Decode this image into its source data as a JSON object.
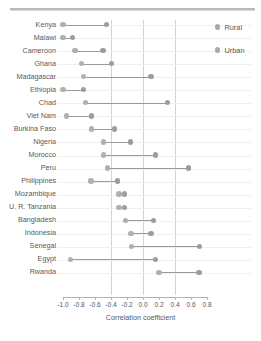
{
  "legend": {
    "position": "top-right",
    "items": [
      {
        "label": "Rural",
        "color": "#a8a8ab",
        "marker": "circle-dot"
      },
      {
        "label": "Urban",
        "color": "#a8a8ab",
        "marker": "circle-dot"
      }
    ]
  },
  "axis": {
    "title": "Correlation coefficient",
    "tick_labels": [
      "-1.0",
      "-0.8",
      "-0.6",
      "-0.4",
      "-0.2",
      "0.0",
      "0.2",
      "0.4",
      "0.6",
      "0.8"
    ]
  },
  "chart_data": {
    "type": "scatter",
    "subtype": "dumbbell",
    "title": "",
    "xlabel": "Correlation coefficient",
    "ylabel": "",
    "xlim": [
      -1.0,
      0.8
    ],
    "xticks": [
      -1.0,
      -0.8,
      -0.6,
      -0.4,
      -0.2,
      0.0,
      0.2,
      0.4,
      0.6,
      0.8
    ],
    "gridlines_vertical": [
      -0.4,
      0.0,
      0.4
    ],
    "grid": true,
    "legend_position": "top-right",
    "categories": [
      "Kenya",
      "Malawi",
      "Cameroon",
      "Ghana",
      "Madagascar",
      "Ethiopia",
      "Chad",
      "Viet Nam",
      "Burkina Faso",
      "Nigeria",
      "Morocco",
      "Peru",
      "Philippines",
      "Mozambique",
      "U. R. Tanzania",
      "Bangladesh",
      "Indonesia",
      "Senegal",
      "Egypt",
      "Rwanda"
    ],
    "series": [
      {
        "name": "Rural",
        "values": [
          -1.0,
          -1.0,
          -0.85,
          -0.77,
          -0.74,
          -1.0,
          -0.72,
          -0.96,
          -0.64,
          -0.49,
          -0.49,
          -0.44,
          -0.65,
          -0.3,
          -0.3,
          -0.22,
          -0.15,
          -0.14,
          -0.91,
          0.2
        ]
      },
      {
        "name": "Urban",
        "values": [
          -0.46,
          -0.88,
          -0.5,
          -0.39,
          0.1,
          -0.74,
          0.31,
          -0.64,
          -0.36,
          -0.16,
          0.16,
          0.57,
          -0.32,
          -0.23,
          -0.23,
          0.13,
          0.1,
          0.71,
          0.16,
          0.7
        ]
      }
    ]
  }
}
